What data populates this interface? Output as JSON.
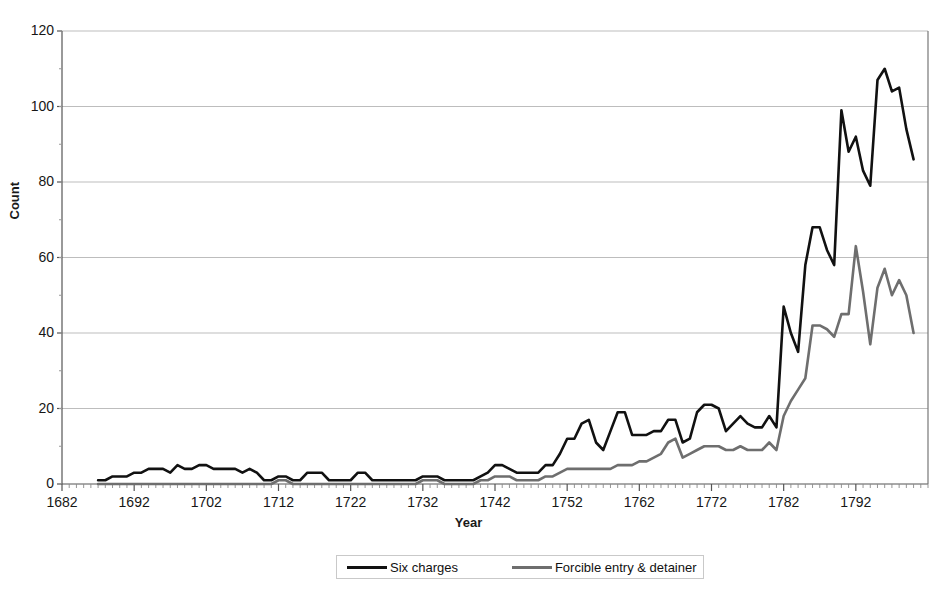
{
  "chart_data": {
    "type": "line",
    "title": "",
    "xlabel": "Year",
    "ylabel": "Count",
    "xlim": [
      1682,
      1802
    ],
    "ylim": [
      0,
      120
    ],
    "grid": true,
    "legend_position": "bottom",
    "x_ticks": [
      "1682",
      "1692",
      "1702",
      "1712",
      "1722",
      "1732",
      "1742",
      "1752",
      "1762",
      "1772",
      "1782",
      "1792"
    ],
    "y_ticks": [
      "0",
      "20",
      "40",
      "60",
      "80",
      "100",
      "120"
    ],
    "x_tick_values": [
      1682,
      1692,
      1702,
      1712,
      1722,
      1732,
      1742,
      1752,
      1762,
      1772,
      1782,
      1792
    ],
    "y_tick_values": [
      0,
      20,
      40,
      60,
      80,
      100,
      120
    ],
    "x": [
      1687,
      1688,
      1689,
      1690,
      1691,
      1692,
      1693,
      1694,
      1695,
      1696,
      1697,
      1698,
      1699,
      1700,
      1701,
      1702,
      1703,
      1704,
      1705,
      1706,
      1707,
      1708,
      1709,
      1710,
      1711,
      1712,
      1713,
      1714,
      1715,
      1716,
      1717,
      1718,
      1719,
      1720,
      1721,
      1722,
      1723,
      1724,
      1725,
      1726,
      1727,
      1728,
      1729,
      1730,
      1731,
      1732,
      1733,
      1734,
      1735,
      1736,
      1737,
      1738,
      1739,
      1740,
      1741,
      1742,
      1743,
      1744,
      1745,
      1746,
      1747,
      1748,
      1749,
      1750,
      1751,
      1752,
      1753,
      1754,
      1755,
      1756,
      1757,
      1758,
      1759,
      1760,
      1761,
      1762,
      1763,
      1764,
      1765,
      1766,
      1767,
      1768,
      1769,
      1770,
      1771,
      1772,
      1773,
      1774,
      1775,
      1776,
      1777,
      1778,
      1779,
      1780,
      1781,
      1782,
      1783,
      1784,
      1785,
      1786,
      1787,
      1788,
      1789,
      1790,
      1791,
      1792,
      1793,
      1794,
      1795,
      1796,
      1797,
      1798,
      1799,
      1800
    ],
    "series": [
      {
        "name": "Six charges",
        "color": "#111111",
        "width": 2.6,
        "values": [
          1,
          1,
          2,
          2,
          2,
          3,
          3,
          4,
          4,
          4,
          3,
          5,
          4,
          4,
          5,
          5,
          4,
          4,
          4,
          4,
          3,
          4,
          3,
          1,
          1,
          2,
          2,
          1,
          1,
          3,
          3,
          3,
          1,
          1,
          1,
          1,
          3,
          3,
          1,
          1,
          1,
          1,
          1,
          1,
          1,
          2,
          2,
          2,
          1,
          1,
          1,
          1,
          1,
          2,
          3,
          5,
          5,
          4,
          3,
          3,
          3,
          3,
          5,
          5,
          8,
          12,
          12,
          16,
          17,
          11,
          9,
          14,
          19,
          19,
          13,
          13,
          13,
          14,
          14,
          17,
          17,
          11,
          12,
          19,
          21,
          21,
          20,
          14,
          16,
          18,
          16,
          15,
          15,
          18,
          15,
          47,
          40,
          35,
          58,
          68,
          68,
          62,
          58,
          99,
          88,
          92,
          83,
          79,
          107,
          110,
          104,
          105,
          94,
          86
        ]
      },
      {
        "name": "Forcible entry & detainer",
        "color": "#6e6e6e",
        "width": 2.6,
        "values": [
          0,
          0,
          0,
          0,
          0,
          0,
          0,
          0,
          0,
          0,
          0,
          0,
          0,
          0,
          0,
          0,
          0,
          0,
          0,
          0,
          0,
          0,
          0,
          0,
          0,
          1,
          1,
          0,
          0,
          0,
          0,
          0,
          0,
          0,
          0,
          0,
          0,
          0,
          0,
          0,
          0,
          0,
          0,
          0,
          0,
          1,
          1,
          1,
          0,
          0,
          0,
          0,
          0,
          1,
          1,
          2,
          2,
          2,
          1,
          1,
          1,
          1,
          2,
          2,
          3,
          4,
          4,
          4,
          4,
          4,
          4,
          4,
          5,
          5,
          5,
          6,
          6,
          7,
          8,
          11,
          12,
          7,
          8,
          9,
          10,
          10,
          10,
          9,
          9,
          10,
          9,
          9,
          9,
          11,
          9,
          18,
          22,
          25,
          28,
          42,
          42,
          41,
          39,
          45,
          45,
          63,
          51,
          37,
          52,
          57,
          50,
          54,
          50,
          40
        ]
      }
    ]
  },
  "legend": {
    "entries": [
      {
        "label": "Six charges"
      },
      {
        "label": "Forcible entry & detainer"
      }
    ]
  }
}
